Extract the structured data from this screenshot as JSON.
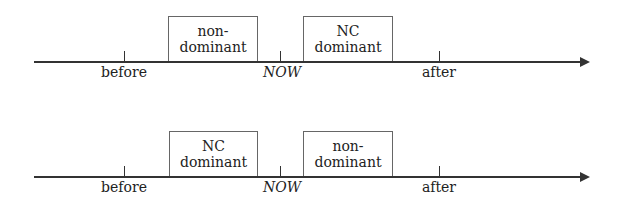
{
  "diagrams": [
    {
      "boxes": [
        {
          "line1": "non-",
          "line2": "dominant"
        },
        {
          "line1": "NC",
          "line2": "dominant"
        }
      ],
      "ticks": [
        {
          "label": "before"
        },
        {
          "label": "NOW"
        },
        {
          "label": "after"
        }
      ]
    },
    {
      "boxes": [
        {
          "line1": "NC",
          "line2": "dominant"
        },
        {
          "line1": "non-",
          "line2": "dominant"
        }
      ],
      "ticks": [
        {
          "label": "before"
        },
        {
          "label": "NOW"
        },
        {
          "label": "after"
        }
      ]
    }
  ]
}
